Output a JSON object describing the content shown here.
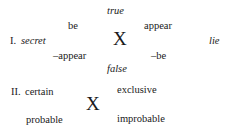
{
  "diagram_1": {
    "label": "I.",
    "left": "secret",
    "top": "true",
    "bottom": "false",
    "upper_left": "be",
    "upper_right": "appear",
    "lower_left": "–appear",
    "lower_right": "–be",
    "right": "lie",
    "center": "X"
  },
  "diagram_2": {
    "label": "II.",
    "upper_left": "certain",
    "upper_right": "exclusive",
    "lower_left": "probable",
    "lower_right": "improbable",
    "center": "X"
  }
}
